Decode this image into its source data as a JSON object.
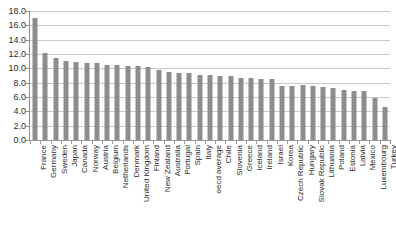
{
  "chart_data": {
    "type": "bar",
    "title": "",
    "subtitle": "",
    "xlabel": "",
    "ylabel": "",
    "ylim": [
      0.0,
      18.0
    ],
    "ytick_step": 2.0,
    "ytick_labels": [
      "18.0",
      "16.0",
      "14.0",
      "12.0",
      "10.0",
      "8.0",
      "6.0",
      "4.0",
      "2.0",
      "0.0"
    ],
    "ytick_values": [
      18.0,
      16.0,
      14.0,
      12.0,
      10.0,
      8.0,
      6.0,
      4.0,
      2.0,
      0.0
    ],
    "grid": true,
    "grid_axis": "y",
    "legend": false,
    "legend_position": "none",
    "bar_color": "#8d8d8d",
    "grid_color": "#c9c9c9",
    "axis_color": "#8f8f8f",
    "background_color": "#ffffff",
    "orientation": "vertical",
    "sorted": "descending",
    "categories": [
      "France",
      "Germany",
      "Sweden",
      "Japan",
      "Canada",
      "Norway",
      "Austria",
      "Belgium",
      "Netherlands",
      "Denmark",
      "United Kingdom",
      "Finland",
      "New Zealand",
      "Australia",
      "Portugal",
      "Spain",
      "Italy",
      "oecd average",
      "Chile",
      "Slovenia",
      "Greece",
      "Iceland",
      "Ireland",
      "Israel",
      "Korea",
      "Czech Republic",
      "Hungary",
      "Slovak Republic",
      "Lithuania",
      "Poland",
      "Estonia",
      "Latvia",
      "Mexico",
      "Luxembourg",
      "Turkey"
    ],
    "values": [
      17.0,
      12.2,
      11.4,
      11.0,
      10.9,
      10.8,
      10.8,
      10.5,
      10.4,
      10.3,
      10.3,
      10.2,
      9.7,
      9.5,
      9.4,
      9.3,
      9.1,
      9.1,
      9.0,
      8.9,
      8.7,
      8.7,
      8.5,
      8.5,
      7.6,
      7.6,
      7.7,
      7.5,
      7.4,
      7.3,
      7.0,
      6.9,
      6.9,
      5.9,
      4.6
    ]
  }
}
